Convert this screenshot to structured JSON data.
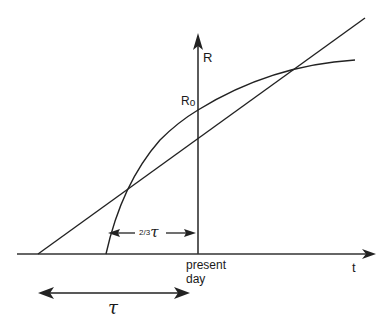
{
  "diagram": {
    "colors": {
      "line": "#222222",
      "background": "#ffffff"
    },
    "axes": {
      "x_label": "t",
      "y_label": "R",
      "origin_label_line1": "present",
      "origin_label_line2": "day"
    },
    "point_label": "R₀",
    "point_label_main": "R",
    "point_label_sub": "o",
    "tangent_line": {
      "from": [
        38,
        254
      ],
      "to": [
        365,
        18
      ]
    },
    "curve": {
      "start": [
        106,
        254
      ],
      "through": [
        198,
        110
      ],
      "end": [
        355,
        60
      ]
    },
    "interval_short": {
      "label_frac": "2/3",
      "label_sym": "τ",
      "from_x": 108,
      "to_x": 196,
      "y": 233
    },
    "interval_long": {
      "label": "τ",
      "from_x": 38,
      "to_x": 190,
      "y": 293
    }
  }
}
